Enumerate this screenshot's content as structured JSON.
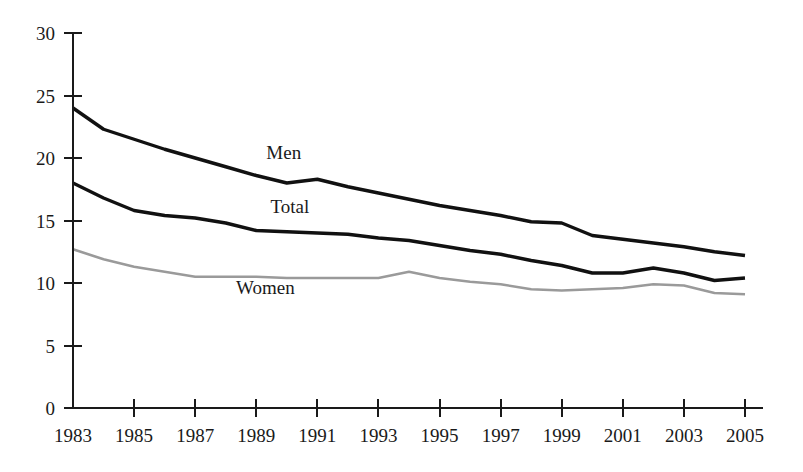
{
  "chart_data": {
    "type": "line",
    "title": "",
    "subtitle": "",
    "xlabel": "",
    "ylabel": "",
    "xlim": [
      1983,
      2005
    ],
    "ylim": [
      0,
      30
    ],
    "grid": false,
    "legend_position": "inline-labels",
    "y_ticks": [
      0,
      5,
      10,
      15,
      20,
      25,
      30
    ],
    "y_tick_labels": [
      "0",
      "5",
      "10",
      "15",
      "20",
      "25",
      "30"
    ],
    "x_ticks": [
      1983,
      1985,
      1987,
      1989,
      1991,
      1993,
      1995,
      1997,
      1999,
      2001,
      2003,
      2005
    ],
    "x_tick_labels": [
      "1983",
      "1985",
      "1987",
      "1989",
      "1991",
      "1993",
      "1995",
      "1997",
      "1999",
      "2001",
      "2003",
      "2005"
    ],
    "x": [
      1983,
      1984,
      1985,
      1986,
      1987,
      1988,
      1989,
      1990,
      1991,
      1992,
      1993,
      1994,
      1995,
      1996,
      1997,
      1998,
      1999,
      2000,
      2001,
      2002,
      2003,
      2004,
      2005
    ],
    "series": [
      {
        "name": "Men",
        "color": "#111111",
        "width": 3.4,
        "values": [
          24.0,
          22.3,
          21.5,
          20.7,
          20.0,
          19.3,
          18.6,
          18.0,
          18.3,
          17.7,
          17.2,
          16.7,
          16.2,
          15.8,
          15.4,
          14.9,
          14.8,
          13.8,
          13.5,
          13.2,
          12.9,
          12.5,
          12.2
        ]
      },
      {
        "name": "Total",
        "color": "#111111",
        "width": 3.4,
        "values": [
          18.0,
          16.8,
          15.8,
          15.4,
          15.2,
          14.8,
          14.2,
          14.1,
          14.0,
          13.9,
          13.6,
          13.4,
          13.0,
          12.6,
          12.3,
          11.8,
          11.4,
          10.8,
          10.8,
          11.2,
          10.8,
          10.2,
          10.4
        ]
      },
      {
        "name": "Women",
        "color": "#9a9a9a",
        "width": 2.6,
        "values": [
          12.7,
          11.9,
          11.3,
          10.9,
          10.5,
          10.5,
          10.5,
          10.4,
          10.4,
          10.4,
          10.4,
          10.9,
          10.4,
          10.1,
          9.9,
          9.5,
          9.4,
          9.5,
          9.6,
          9.9,
          9.8,
          9.2,
          9.1
        ]
      }
    ],
    "annotations": [
      {
        "text": "Men",
        "x_value": 1989.9,
        "y_value": 19.9
      },
      {
        "text": "Total",
        "x_value": 1990.1,
        "y_value": 15.6
      },
      {
        "text": "Women",
        "x_value": 1989.3,
        "y_value": 9.1
      }
    ]
  },
  "axes": {
    "y_axis_name": "y-axis",
    "x_axis_name": "x-axis"
  }
}
